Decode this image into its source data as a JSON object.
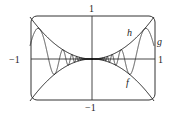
{
  "diagram": {
    "type": "function-plot",
    "axes": {
      "x_left_label": "−1",
      "x_right_label": "1",
      "y_top_label": "1",
      "y_bottom_label": "−1"
    },
    "curves": [
      {
        "name": "h",
        "label": "h",
        "formula": "x^2"
      },
      {
        "name": "g",
        "label": "g",
        "formula": "x^2 sin(pi/x)"
      },
      {
        "name": "f",
        "label": "f",
        "formula": "-x^2"
      }
    ],
    "colors": {
      "line": "#222222",
      "background": "#ffffff"
    }
  }
}
